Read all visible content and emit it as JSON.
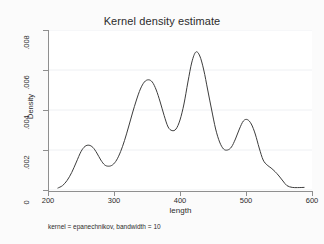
{
  "chart_data": {
    "type": "line",
    "title": "Kernel density estimate",
    "xlabel": "length",
    "ylabel": "Density",
    "note": "kernel = epanechnikov, bandwidth = 10",
    "xlim": [
      200,
      600
    ],
    "ylim": [
      0,
      0.008
    ],
    "xticks": [
      "200",
      "300",
      "400",
      "500",
      "600"
    ],
    "xtick_values": [
      200,
      300,
      400,
      500,
      600
    ],
    "yticks": [
      "0",
      ".002",
      ".004",
      ".006",
      ".008"
    ],
    "ytick_values": [
      0,
      0.002,
      0.004,
      0.006,
      0.008
    ],
    "grid": "horizontal",
    "legend": "none",
    "line_color": "#3d3d3d",
    "panel_color": "#ffffff",
    "background_color": "#fbfbfb",
    "series": [
      {
        "name": "Density",
        "x": [
          215,
          222,
          229,
          236,
          243,
          250,
          256,
          262,
          268,
          274,
          280,
          286,
          292,
          298,
          304,
          310,
          316,
          322,
          328,
          334,
          340,
          346,
          352,
          358,
          364,
          370,
          376,
          382,
          388,
          394,
          400,
          406,
          412,
          418,
          424,
          430,
          436,
          442,
          448,
          454,
          460,
          466,
          472,
          478,
          484,
          490,
          496,
          502,
          508,
          514,
          520,
          526,
          532,
          538,
          544,
          550,
          556,
          562,
          570,
          578,
          588
        ],
        "y": [
          0.0001,
          0.00022,
          0.00048,
          0.00088,
          0.0014,
          0.00192,
          0.00218,
          0.00224,
          0.00213,
          0.00185,
          0.0015,
          0.00125,
          0.00119,
          0.00126,
          0.0015,
          0.00192,
          0.00248,
          0.00315,
          0.00385,
          0.0045,
          0.00505,
          0.0054,
          0.00551,
          0.0054,
          0.005,
          0.0044,
          0.00372,
          0.00315,
          0.00297,
          0.00305,
          0.0035,
          0.0043,
          0.0054,
          0.0064,
          0.0069,
          0.0067,
          0.006,
          0.005,
          0.004,
          0.00305,
          0.0024,
          0.00205,
          0.002,
          0.00215,
          0.00255,
          0.00305,
          0.00345,
          0.00352,
          0.0033,
          0.0028,
          0.0021,
          0.0015,
          0.00125,
          0.0011,
          0.00092,
          0.0007,
          0.00045,
          0.00022,
          0.00013,
          0.00012,
          0.00013
        ]
      }
    ]
  }
}
